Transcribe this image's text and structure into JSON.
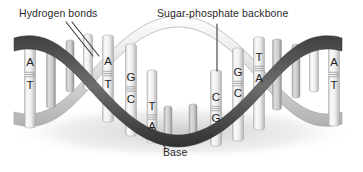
{
  "figure": {
    "background_color": "#ffffff"
  },
  "annotations": {
    "hydrogen_bonds": {
      "label": "Hydrogen bonds",
      "leader": {
        "x1": 66,
        "y1": 22,
        "x2": 93,
        "y2": 56
      }
    },
    "backbone": {
      "label": "Sugar-phosphate backbone",
      "leader": {
        "x1": 217,
        "y1": 24,
        "x2": 217,
        "y2": 71
      }
    },
    "base": {
      "label": "Base",
      "leader": {
        "x1": 152,
        "y1": 128,
        "x2": 166,
        "y2": 149
      }
    }
  },
  "colors": {
    "ribbon_dark": "#4d4d4d",
    "ribbon_mid": "#9a9a9a",
    "ribbon_light": "#e2e2e2",
    "rung_light": "#f2f2f2",
    "rung_shadow": "#b9b9b9",
    "letter": "#1e1e1e",
    "leader_line": "#3a3a3a",
    "shadow": "#d8d8d8"
  },
  "base_pairs": [
    {
      "id": "bp-1",
      "top": "A",
      "bottom": "T",
      "x": 30,
      "top_y": 63,
      "bottom_y": 86,
      "rod_top": 37,
      "rod_bottom": 128,
      "width": 11,
      "shade": "light"
    },
    {
      "id": "bp-2",
      "top": "",
      "bottom": "",
      "x": 51,
      "top_y": 0,
      "bottom_y": 0,
      "rod_top": 46,
      "rod_bottom": 108,
      "width": 9,
      "shade": "mid"
    },
    {
      "id": "bp-3",
      "top": "",
      "bottom": "",
      "x": 70,
      "top_y": 0,
      "bottom_y": 0,
      "rod_top": 40,
      "rod_bottom": 92,
      "width": 8,
      "shade": "mid"
    },
    {
      "id": "bp-4",
      "top": "",
      "bottom": "",
      "x": 88,
      "top_y": 0,
      "bottom_y": 0,
      "rod_top": 34,
      "rod_bottom": 90,
      "width": 9,
      "shade": "light"
    },
    {
      "id": "bp-5",
      "top": "A",
      "bottom": "T",
      "x": 108,
      "top_y": 62,
      "bottom_y": 85,
      "rod_top": 35,
      "rod_bottom": 122,
      "width": 11,
      "shade": "light"
    },
    {
      "id": "bp-6",
      "top": "G",
      "bottom": "C",
      "x": 131,
      "top_y": 78,
      "bottom_y": 100,
      "rod_top": 44,
      "rod_bottom": 136,
      "width": 11,
      "shade": "light"
    },
    {
      "id": "bp-7",
      "top": "T",
      "bottom": "A",
      "x": 152,
      "top_y": 107,
      "bottom_y": 127,
      "rod_top": 70,
      "rod_bottom": 143,
      "width": 10,
      "shade": "light"
    },
    {
      "id": "bp-8",
      "top": "",
      "bottom": "",
      "x": 168,
      "top_y": 0,
      "bottom_y": 0,
      "rod_top": 106,
      "rod_bottom": 145,
      "width": 8,
      "shade": "mid"
    },
    {
      "id": "bp-9",
      "top": "",
      "bottom": "",
      "x": 193,
      "top_y": 0,
      "bottom_y": 0,
      "rod_top": 104,
      "rod_bottom": 140,
      "width": 8,
      "shade": "mid"
    },
    {
      "id": "bp-10",
      "top": "C",
      "bottom": "G",
      "x": 216,
      "top_y": 98,
      "bottom_y": 119,
      "rod_top": 70,
      "rod_bottom": 146,
      "width": 11,
      "shade": "light"
    },
    {
      "id": "bp-11",
      "top": "G",
      "bottom": "C",
      "x": 238,
      "top_y": 73,
      "bottom_y": 94,
      "rod_top": 48,
      "rod_bottom": 141,
      "width": 11,
      "shade": "light"
    },
    {
      "id": "bp-12",
      "top": "T",
      "bottom": "A",
      "x": 259,
      "top_y": 58,
      "bottom_y": 79,
      "rod_top": 37,
      "rod_bottom": 130,
      "width": 11,
      "shade": "light"
    },
    {
      "id": "bp-13",
      "top": "",
      "bottom": "",
      "x": 277,
      "top_y": 0,
      "bottom_y": 0,
      "rod_top": 39,
      "rod_bottom": 110,
      "width": 9,
      "shade": "mid"
    },
    {
      "id": "bp-14",
      "top": "",
      "bottom": "",
      "x": 296,
      "top_y": 0,
      "bottom_y": 0,
      "rod_top": 44,
      "rod_bottom": 98,
      "width": 8,
      "shade": "mid"
    },
    {
      "id": "bp-15",
      "top": "",
      "bottom": "",
      "x": 314,
      "top_y": 0,
      "bottom_y": 0,
      "rod_top": 38,
      "rod_bottom": 92,
      "width": 9,
      "shade": "light"
    },
    {
      "id": "bp-16",
      "top": "A",
      "bottom": "T",
      "x": 334,
      "top_y": 63,
      "bottom_y": 86,
      "rod_top": 36,
      "rod_bottom": 126,
      "width": 11,
      "shade": "light"
    }
  ],
  "helix": {
    "strand_front_path": "M 14,40 C 50,30 72,54 96,80 C 122,110 146,136 176,136 C 206,136 230,110 256,80 C 280,54 302,30 338,40",
    "strand_back_path": "M 14,122 C 50,132 72,108 96,82 C 122,52 146,26 176,26 C 206,26 230,52 256,82 C 280,108 302,132 338,122",
    "turns": 2,
    "width_px": 363,
    "height_px": 172
  }
}
